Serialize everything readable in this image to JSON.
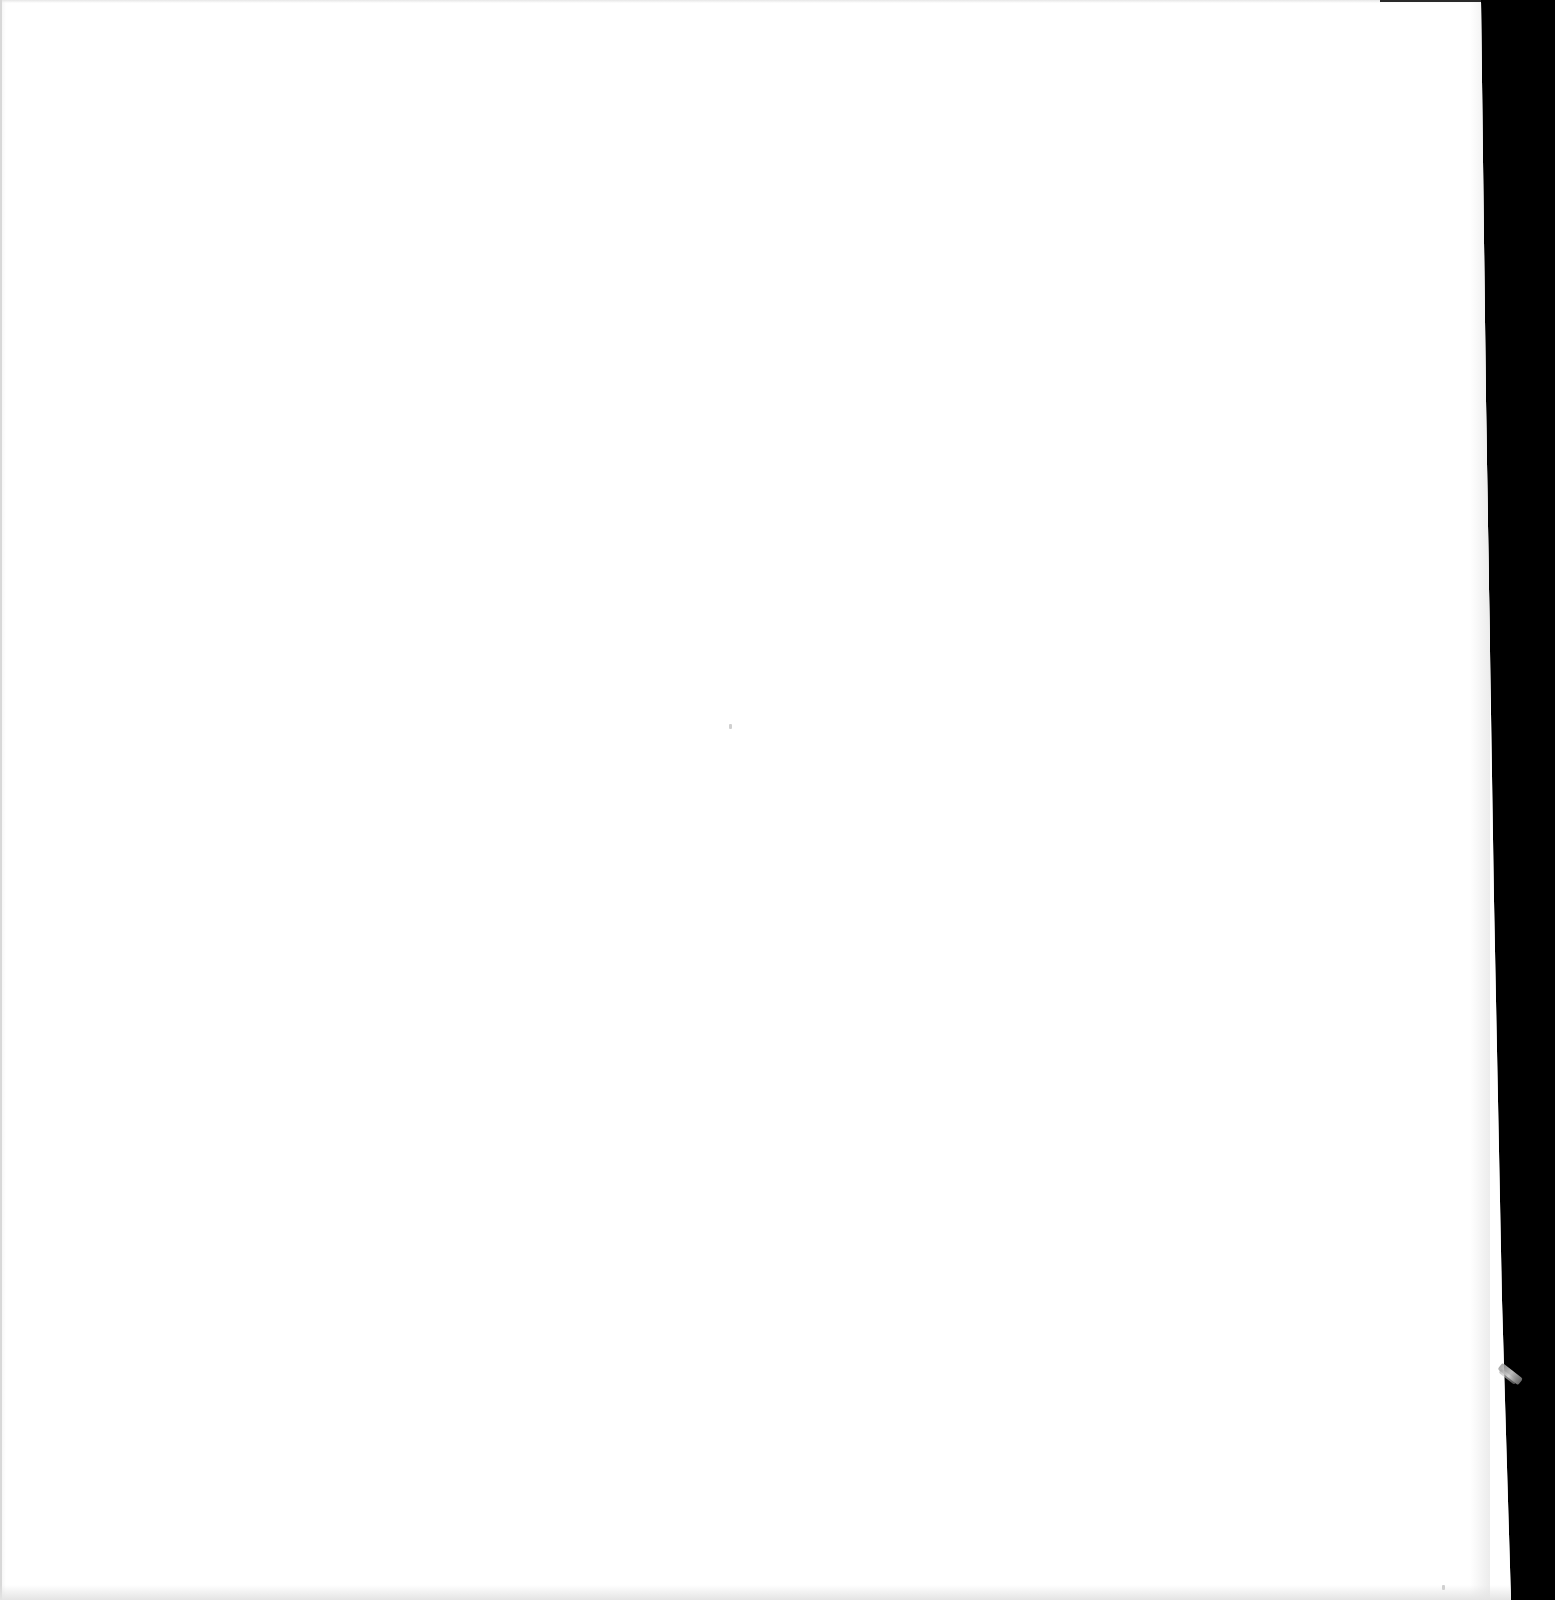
{
  "document": {
    "type": "scanned-page",
    "state": "blank",
    "text_content": "",
    "colors": {
      "paper": "#ffffff",
      "scanner_background": "#000000",
      "artifact": "#9a9a9a"
    },
    "artifacts": [
      {
        "name": "black-scan-border",
        "position": "right-edge"
      },
      {
        "name": "folded-corner-artifact",
        "position": "right-edge-lower"
      },
      {
        "name": "top-edge-dark-line",
        "position": "top-right"
      }
    ]
  }
}
